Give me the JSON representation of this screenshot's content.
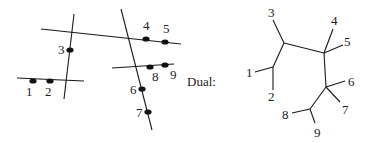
{
  "diagram": {
    "dual_label": "Dual:",
    "colors": {
      "stroke": "#1a1a1a",
      "dot": "#111111",
      "text": "#222222",
      "background": "#ffffff"
    },
    "left_panel": {
      "lines": [
        {
          "id": "A",
          "x1": 41,
          "y1": 29,
          "x2": 181,
          "y2": 44
        },
        {
          "id": "B",
          "x1": 74,
          "y1": 14,
          "x2": 64,
          "y2": 99
        },
        {
          "id": "C",
          "x1": 17,
          "y1": 78,
          "x2": 84,
          "y2": 81
        },
        {
          "id": "D",
          "x1": 121,
          "y1": 9,
          "x2": 152,
          "y2": 130
        },
        {
          "id": "E",
          "x1": 112,
          "y1": 68,
          "x2": 174,
          "y2": 64
        }
      ],
      "points": [
        {
          "label": "1",
          "cx": 33,
          "cy": 81,
          "lx": 26,
          "ly": 96
        },
        {
          "label": "2",
          "cx": 50,
          "cy": 81,
          "lx": 45,
          "ly": 96
        },
        {
          "label": "3",
          "cx": 70,
          "cy": 50,
          "lx": 58,
          "ly": 54
        },
        {
          "label": "4",
          "cx": 146,
          "cy": 39,
          "lx": 143,
          "ly": 30
        },
        {
          "label": "5",
          "cx": 165,
          "cy": 42,
          "lx": 163,
          "ly": 33
        },
        {
          "label": "6",
          "cx": 142,
          "cy": 89,
          "lx": 130,
          "ly": 94
        },
        {
          "label": "7",
          "cx": 148,
          "cy": 112,
          "lx": 136,
          "ly": 117
        },
        {
          "label": "8",
          "cx": 150,
          "cy": 67,
          "lx": 152,
          "ly": 81
        },
        {
          "label": "9",
          "cx": 165,
          "cy": 65,
          "lx": 170,
          "ly": 79
        }
      ]
    },
    "dual_tree": {
      "edges": [
        {
          "x1": 284,
          "y1": 43,
          "x2": 324,
          "y2": 53
        },
        {
          "x1": 324,
          "y1": 53,
          "x2": 326,
          "y2": 87
        },
        {
          "x1": 284,
          "y1": 43,
          "x2": 273,
          "y2": 67
        },
        {
          "x1": 326,
          "y1": 87,
          "x2": 310,
          "y2": 109
        },
        {
          "x1": 284,
          "y1": 43,
          "x2": 273,
          "y2": 20
        },
        {
          "x1": 324,
          "y1": 53,
          "x2": 333,
          "y2": 29
        },
        {
          "x1": 324,
          "y1": 53,
          "x2": 343,
          "y2": 45
        },
        {
          "x1": 273,
          "y1": 67,
          "x2": 255,
          "y2": 72
        },
        {
          "x1": 273,
          "y1": 67,
          "x2": 273,
          "y2": 90
        },
        {
          "x1": 326,
          "y1": 87,
          "x2": 345,
          "y2": 81
        },
        {
          "x1": 326,
          "y1": 87,
          "x2": 340,
          "y2": 102
        },
        {
          "x1": 310,
          "y1": 109,
          "x2": 292,
          "y2": 113
        },
        {
          "x1": 310,
          "y1": 109,
          "x2": 315,
          "y2": 123
        }
      ],
      "leaves": [
        {
          "label": "1",
          "x": 246,
          "y": 77
        },
        {
          "label": "2",
          "x": 268,
          "y": 101
        },
        {
          "label": "3",
          "x": 268,
          "y": 17
        },
        {
          "label": "4",
          "x": 331,
          "y": 25
        },
        {
          "label": "5",
          "x": 344,
          "y": 46
        },
        {
          "label": "6",
          "x": 348,
          "y": 86
        },
        {
          "label": "7",
          "x": 342,
          "y": 114
        },
        {
          "label": "8",
          "x": 282,
          "y": 119
        },
        {
          "label": "9",
          "x": 314,
          "y": 137
        }
      ]
    }
  }
}
